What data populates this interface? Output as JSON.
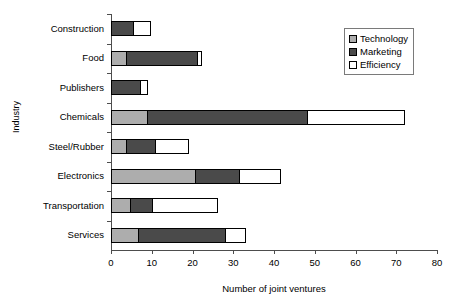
{
  "chart_data": {
    "type": "bar",
    "orientation": "horizontal",
    "stacked": true,
    "title": "",
    "xlabel": "Number of joint ventures",
    "ylabel": "Industry",
    "xlim": [
      0,
      80
    ],
    "xticks": [
      0,
      10,
      20,
      30,
      40,
      50,
      60,
      70,
      80
    ],
    "grid": false,
    "legend_position": "top-right",
    "categories": [
      "Construction",
      "Food",
      "Publishers",
      "Chemicals",
      "Steel/Rubber",
      "Electronics",
      "Transportation",
      "Services"
    ],
    "series": [
      {
        "name": "Technology",
        "color": "#adadad",
        "values": [
          0,
          3.7,
          0,
          8.8,
          3.7,
          20.5,
          4.6,
          6.6
        ]
      },
      {
        "name": "Marketing",
        "color": "#4a4a4a",
        "values": [
          5.5,
          17.3,
          7.0,
          39.2,
          7.0,
          11.0,
          5.4,
          21.4
        ]
      },
      {
        "name": "Efficiency",
        "color": "#ffffff",
        "values": [
          4.0,
          1.0,
          1.8,
          24.0,
          8.1,
          10.0,
          16.0,
          5.0
        ]
      }
    ],
    "totals": [
      9.5,
      22.0,
      8.8,
      72.0,
      18.8,
      41.5,
      26.0,
      33.0
    ]
  },
  "legend": {
    "items": [
      {
        "label": "Technology",
        "color": "#adadad"
      },
      {
        "label": "Marketing",
        "color": "#4a4a4a"
      },
      {
        "label": "Efficiency",
        "color": "#ffffff"
      }
    ]
  }
}
